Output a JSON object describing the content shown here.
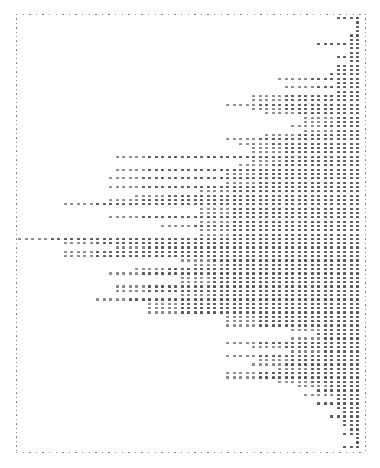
{
  "chart_data": {
    "type": "bar",
    "orientation": "horizontal",
    "style": "dot-matrix printed histogram, bars extend leftward from right axis",
    "title": "",
    "xlabel": "",
    "ylabel": "",
    "grid": false,
    "legend": null,
    "frame": {
      "left": 16,
      "top": 14,
      "right": 365,
      "bottom": 452,
      "style": "dotted"
    },
    "layout": {
      "right_x": 356,
      "first_row_y": 17,
      "row_pitch": 4.33,
      "col_pitch": 6.5
    },
    "row_left_x": [
      336,
      360,
      360,
      360,
      348,
      348,
      316,
      348,
      348,
      336,
      348,
      336,
      336,
      328,
      278,
      336,
      284,
      336,
      250,
      250,
      230,
      250,
      262,
      304,
      304,
      290,
      304,
      262,
      230,
      242,
      250,
      250,
      116,
      248,
      242,
      116,
      230,
      110,
      230,
      110,
      196,
      130,
      110,
      62,
      196,
      196,
      110,
      196,
      160,
      196,
      200,
      20,
      62,
      116,
      62,
      62,
      176,
      190,
      130,
      108,
      176,
      176,
      116,
      116,
      176,
      94,
      150,
      150,
      150,
      224,
      224,
      224,
      290,
      320,
      290,
      224,
      250,
      290,
      224,
      256,
      250,
      276,
      224,
      230,
      276,
      296,
      316,
      304,
      336,
      316,
      336,
      342,
      330,
      342,
      342,
      348,
      342,
      354,
      360,
      341
    ],
    "values": [
      4,
      1,
      1,
      1,
      2,
      2,
      7,
      2,
      2,
      4,
      2,
      4,
      4,
      5,
      13,
      4,
      12,
      4,
      17,
      17,
      21,
      17,
      15,
      9,
      9,
      11,
      9,
      15,
      21,
      19,
      17,
      17,
      38,
      17,
      19,
      38,
      21,
      39,
      21,
      39,
      25,
      35,
      39,
      46,
      25,
      25,
      39,
      25,
      31,
      25,
      25,
      53,
      46,
      38,
      46,
      46,
      28,
      26,
      35,
      39,
      28,
      28,
      38,
      38,
      28,
      41,
      33,
      33,
      33,
      21,
      21,
      21,
      11,
      7,
      11,
      21,
      17,
      11,
      21,
      16,
      17,
      13,
      21,
      21,
      13,
      10,
      7,
      9,
      4,
      7,
      4,
      3,
      5,
      3,
      3,
      2,
      3,
      1,
      1,
      3
    ],
    "n_rows": 100
  }
}
